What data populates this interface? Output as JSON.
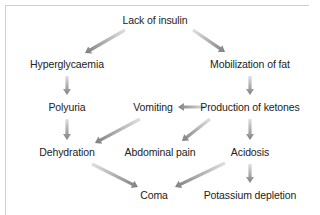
{
  "diagram": {
    "type": "flowchart",
    "arrow_color_head": "#808080",
    "arrow_color_tail": "#e0e0e0",
    "nodes": [
      {
        "id": "lack_insulin",
        "label": "Lack of insulin",
        "x": 155,
        "y": 20
      },
      {
        "id": "hyperglycaemia",
        "label": "Hyperglycaemia",
        "x": 67,
        "y": 64
      },
      {
        "id": "mobilization_fat",
        "label": "Mobilization of fat",
        "x": 250,
        "y": 64
      },
      {
        "id": "polyuria",
        "label": "Polyuria",
        "x": 67,
        "y": 107
      },
      {
        "id": "vomiting",
        "label": "Vomiting",
        "x": 153,
        "y": 107
      },
      {
        "id": "production_ketones",
        "label": "Production of ketones",
        "x": 250,
        "y": 107
      },
      {
        "id": "dehydration",
        "label": "Dehydration",
        "x": 67,
        "y": 152
      },
      {
        "id": "abdominal_pain",
        "label": "Abdominal pain",
        "x": 160,
        "y": 152
      },
      {
        "id": "acidosis",
        "label": "Acidosis",
        "x": 250,
        "y": 152
      },
      {
        "id": "coma",
        "label": "Coma",
        "x": 154,
        "y": 195
      },
      {
        "id": "potassium_depletion",
        "label": "Potassium depletion",
        "x": 250,
        "y": 195
      }
    ],
    "edges": [
      {
        "from": "lack_insulin",
        "to": "hyperglycaemia",
        "x1": 125,
        "y1": 30,
        "x2": 85,
        "y2": 53
      },
      {
        "from": "lack_insulin",
        "to": "mobilization_fat",
        "x1": 193,
        "y1": 30,
        "x2": 225,
        "y2": 52
      },
      {
        "from": "hyperglycaemia",
        "to": "polyuria",
        "x1": 67,
        "y1": 76,
        "x2": 67,
        "y2": 95
      },
      {
        "from": "mobilization_fat",
        "to": "production_ketones",
        "x1": 250,
        "y1": 76,
        "x2": 250,
        "y2": 95
      },
      {
        "from": "production_ketones",
        "to": "vomiting",
        "x1": 205,
        "y1": 107,
        "x2": 178,
        "y2": 107
      },
      {
        "from": "polyuria",
        "to": "dehydration",
        "x1": 67,
        "y1": 119,
        "x2": 67,
        "y2": 140
      },
      {
        "from": "vomiting",
        "to": "dehydration",
        "x1": 140,
        "y1": 119,
        "x2": 95,
        "y2": 143
      },
      {
        "from": "production_ketones",
        "to": "abdominal_pain",
        "x1": 210,
        "y1": 119,
        "x2": 182,
        "y2": 141
      },
      {
        "from": "production_ketones",
        "to": "acidosis",
        "x1": 250,
        "y1": 119,
        "x2": 250,
        "y2": 140
      },
      {
        "from": "dehydration",
        "to": "coma",
        "x1": 92,
        "y1": 164,
        "x2": 138,
        "y2": 187
      },
      {
        "from": "acidosis",
        "to": "coma",
        "x1": 225,
        "y1": 163,
        "x2": 175,
        "y2": 187
      },
      {
        "from": "acidosis",
        "to": "potassium_depletion",
        "x1": 250,
        "y1": 164,
        "x2": 250,
        "y2": 183
      }
    ]
  }
}
